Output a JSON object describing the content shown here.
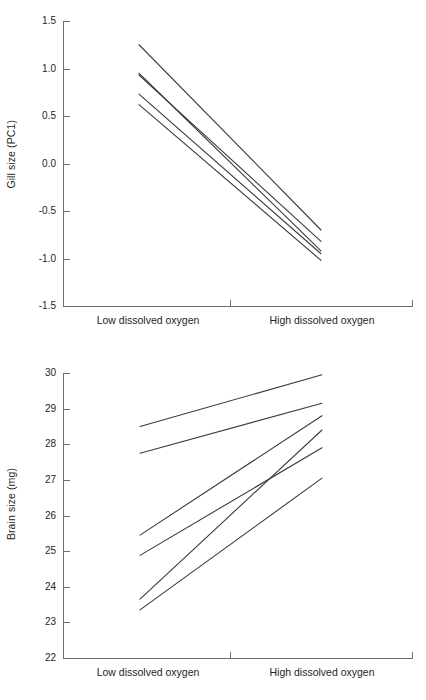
{
  "figure": {
    "title": "",
    "panels": [
      "gill",
      "brain"
    ]
  },
  "chart_data": [
    {
      "type": "line",
      "id": "gill",
      "title": "",
      "xlabel": "",
      "ylabel": "Gill size (PC1)",
      "categories": [
        "Low dissolved oxygen",
        "High dissolved oxygen"
      ],
      "xtick_labels": [
        "Low dissolved oxygen",
        "High dissolved oxygen"
      ],
      "ytick_labels": [
        "1.5",
        "1.0",
        "0.5",
        "0.0",
        "-0.5",
        "-1.0",
        "-1.5"
      ],
      "ytick_values": [
        1.5,
        1.0,
        0.5,
        0.0,
        -0.5,
        -1.0,
        -1.5
      ],
      "ylim": [
        -1.5,
        1.5
      ],
      "grid": false,
      "legend": "none",
      "series": [
        {
          "name": "line-1",
          "values": [
            1.25,
            -0.7
          ]
        },
        {
          "name": "line-2",
          "values": [
            0.95,
            -0.92
          ]
        },
        {
          "name": "line-3",
          "values": [
            0.93,
            -0.82
          ]
        },
        {
          "name": "line-4",
          "values": [
            0.73,
            -0.95
          ]
        },
        {
          "name": "line-5",
          "values": [
            0.62,
            -1.02
          ]
        }
      ]
    },
    {
      "type": "line",
      "id": "brain",
      "title": "",
      "xlabel": "",
      "ylabel": "Brain size (mg)",
      "categories": [
        "Low dissolved oxygen",
        "High dissolved oxygen"
      ],
      "xtick_labels": [
        "Low dissolved oxygen",
        "High dissolved oxygen"
      ],
      "ytick_labels": [
        "30",
        "29",
        "28",
        "27",
        "26",
        "25",
        "24",
        "23",
        "22"
      ],
      "ytick_values": [
        30,
        29,
        28,
        27,
        26,
        25,
        24,
        23,
        22
      ],
      "ylim": [
        22,
        30
      ],
      "grid": false,
      "legend": "none",
      "series": [
        {
          "name": "line-1",
          "values": [
            28.5,
            29.95
          ]
        },
        {
          "name": "line-2",
          "values": [
            27.75,
            29.15
          ]
        },
        {
          "name": "line-3",
          "values": [
            25.45,
            28.8
          ]
        },
        {
          "name": "line-4",
          "values": [
            24.88,
            27.9
          ]
        },
        {
          "name": "line-5",
          "values": [
            23.65,
            28.4
          ]
        },
        {
          "name": "line-6",
          "values": [
            23.35,
            27.05
          ]
        }
      ]
    }
  ],
  "colors": {
    "line": "#3b3b3d",
    "axis": "#6d6e71",
    "text": "#231f20",
    "background": "#ffffff"
  }
}
